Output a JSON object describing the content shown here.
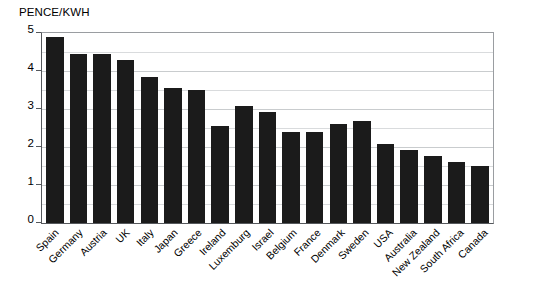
{
  "chart_data": {
    "type": "bar",
    "title": "PENCE/KWH",
    "xlabel": "",
    "ylabel": "",
    "ylim": [
      0,
      5
    ],
    "y_ticks": [
      0,
      1,
      2,
      3,
      4,
      5
    ],
    "y_tick_labels": [
      "0",
      "1",
      "2",
      "3",
      "4",
      "5"
    ],
    "gridlines": [
      0.5,
      1,
      1.5,
      2,
      2.5,
      3,
      3.5,
      4,
      4.5
    ],
    "grid": true,
    "legend": false,
    "bar_color": "#1b1b1b",
    "categories": [
      "Spain",
      "Germany",
      "Austria",
      "UK",
      "Italy",
      "Japan",
      "Greece",
      "Ireland",
      "Luxemburg",
      "Israel",
      "Belgium",
      "France",
      "Denmark",
      "Sweden",
      "USA",
      "Australia",
      "New Zealand",
      "South Africa",
      "Canada"
    ],
    "values": [
      4.9,
      4.45,
      4.45,
      4.3,
      3.85,
      3.55,
      3.5,
      2.55,
      3.08,
      2.93,
      2.4,
      2.4,
      2.6,
      2.68,
      2.08,
      1.92,
      1.77,
      1.6,
      1.5
    ]
  }
}
